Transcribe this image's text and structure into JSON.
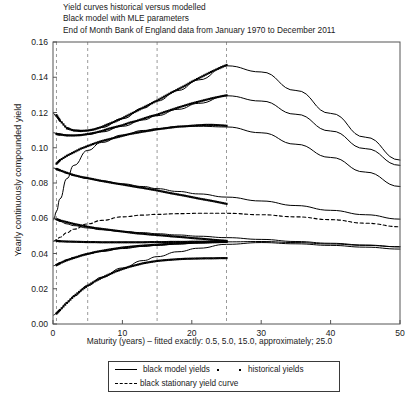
{
  "title": {
    "line1": "Yield curves historical versus modelled",
    "line2": "Black model with MLE parameters",
    "line3": "End of Month Bank of England data from January 1970 to December 2011"
  },
  "axes": {
    "ylabel": "Yearly continuously compounded yield",
    "xlabel": "Maturity (years) – fitted exactly: 0.5, 5.0, 15.0, approximately; 25.0",
    "yticks": [
      "0.00",
      "0.02",
      "0.04",
      "0.06",
      "0.08",
      "0.10",
      "0.12",
      "0.14",
      "0.16"
    ],
    "xticks": [
      "0",
      "10",
      "20",
      "30",
      "40",
      "50"
    ]
  },
  "legend": {
    "model_label": "black model yields",
    "historical_label": "historical yields",
    "stationary_label": "black stationary yield curve"
  },
  "chart_data": {
    "type": "line",
    "title": "Yield curves historical versus modelled",
    "subtitle": "Black model with MLE parameters; End of Month Bank of England data from January 1970 to December 2011",
    "xlabel": "Maturity (years) – fitted exactly: 0.5, 5.0, 15.0, approximately; 25.0",
    "ylabel": "Yearly continuously compounded yield",
    "xlim": [
      0,
      50
    ],
    "ylim": [
      0.0,
      0.16
    ],
    "grid": "vertical dashed at fitted maturities",
    "gridlines_x": [
      0.5,
      5.0,
      15.0,
      25.0
    ],
    "legend_position": "below-axes",
    "colors": {
      "line": "#000000",
      "marker": "#000000",
      "dashed": "#000000"
    },
    "series": [
      {
        "name": "model yield curve 1",
        "style": "solid",
        "x": [
          0.1,
          0.5,
          1,
          2,
          3,
          5,
          7,
          10,
          13,
          15,
          18,
          21,
          25,
          30,
          35,
          40,
          45,
          50
        ],
        "y": [
          0.1195,
          0.1175,
          0.115,
          0.1115,
          0.11,
          0.1098,
          0.1115,
          0.1165,
          0.1225,
          0.1265,
          0.1325,
          0.1385,
          0.1465,
          0.143,
          0.1325,
          0.1195,
          0.106,
          0.093
        ]
      },
      {
        "name": "historical yields 1",
        "style": "markers",
        "x": [
          0.5,
          1,
          2,
          3,
          4,
          5,
          6,
          7,
          8,
          9,
          10,
          11,
          12,
          13,
          14,
          15,
          16,
          17,
          18,
          19,
          20,
          21,
          22,
          23,
          24,
          25
        ],
        "y": [
          0.1185,
          0.1155,
          0.111,
          0.1098,
          0.1095,
          0.1098,
          0.1105,
          0.1118,
          0.1135,
          0.115,
          0.1168,
          0.1188,
          0.1208,
          0.1228,
          0.1248,
          0.1268,
          0.129,
          0.1312,
          0.1332,
          0.1352,
          0.1375,
          0.1395,
          0.1415,
          0.1435,
          0.1452,
          0.147
        ]
      },
      {
        "name": "model yield curve 2",
        "style": "solid",
        "x": [
          0.1,
          0.5,
          1,
          2,
          3,
          5,
          7,
          10,
          13,
          15,
          18,
          21,
          25,
          30,
          35,
          40,
          45,
          50
        ],
        "y": [
          0.1085,
          0.1082,
          0.1078,
          0.1072,
          0.107,
          0.1075,
          0.109,
          0.1122,
          0.1158,
          0.1182,
          0.1218,
          0.1252,
          0.1295,
          0.1265,
          0.119,
          0.1095,
          0.0995,
          0.09
        ]
      },
      {
        "name": "historical yields 2",
        "style": "markers",
        "x": [
          0.5,
          1,
          2,
          3,
          4,
          5,
          6,
          7,
          8,
          9,
          10,
          11,
          12,
          13,
          14,
          15,
          16,
          17,
          18,
          19,
          20,
          21,
          22,
          23,
          24,
          25
        ],
        "y": [
          0.1078,
          0.1075,
          0.107,
          0.107,
          0.1072,
          0.1078,
          0.1085,
          0.1095,
          0.1108,
          0.1118,
          0.1128,
          0.1142,
          0.1152,
          0.1165,
          0.1178,
          0.1188,
          0.1202,
          0.1215,
          0.1228,
          0.124,
          0.1252,
          0.1262,
          0.1272,
          0.1282,
          0.129,
          0.1298
        ]
      },
      {
        "name": "model yield curve 3 (rising from low short rate)",
        "style": "solid",
        "x": [
          0.1,
          0.5,
          1,
          2,
          3,
          5,
          7,
          10,
          13,
          15,
          18,
          21,
          25,
          30,
          35,
          40,
          45,
          50
        ],
        "y": [
          0.059,
          0.064,
          0.071,
          0.0825,
          0.09,
          0.0985,
          0.103,
          0.1072,
          0.1098,
          0.1108,
          0.112,
          0.1122,
          0.1118,
          0.1085,
          0.102,
          0.0945,
          0.0862,
          0.078
        ]
      },
      {
        "name": "historical yields 3",
        "style": "markers",
        "x": [
          0.5,
          1,
          2,
          3,
          4,
          5,
          6,
          7,
          8,
          9,
          10,
          11,
          12,
          13,
          14,
          15,
          16,
          17,
          18,
          19,
          20,
          21,
          22,
          23,
          24,
          25
        ],
        "y": [
          0.091,
          0.093,
          0.0955,
          0.0975,
          0.0995,
          0.101,
          0.1025,
          0.1038,
          0.1048,
          0.1058,
          0.1068,
          0.1078,
          0.1085,
          0.1092,
          0.1098,
          0.1105,
          0.111,
          0.1115,
          0.112,
          0.1122,
          0.1125,
          0.1128,
          0.113,
          0.113,
          0.1128,
          0.1125
        ]
      },
      {
        "name": "model yield curve 4 (declining from high short rate)",
        "style": "solid",
        "x": [
          0.1,
          0.5,
          1,
          2,
          3,
          5,
          7,
          10,
          13,
          15,
          18,
          21,
          25,
          30,
          35,
          40,
          45,
          50
        ],
        "y": [
          0.0885,
          0.088,
          0.0872,
          0.0855,
          0.0842,
          0.0825,
          0.0812,
          0.0795,
          0.078,
          0.0768,
          0.0752,
          0.0738,
          0.072,
          0.0698,
          0.0672,
          0.0645,
          0.062,
          0.0595
        ]
      },
      {
        "name": "historical yields 4",
        "style": "markers",
        "x": [
          0.5,
          1,
          2,
          3,
          4,
          5,
          6,
          7,
          8,
          9,
          10,
          11,
          12,
          13,
          14,
          15,
          16,
          17,
          18,
          19,
          20,
          21,
          22,
          23,
          24,
          25
        ],
        "y": [
          0.088,
          0.0872,
          0.0858,
          0.0845,
          0.0835,
          0.0828,
          0.082,
          0.0812,
          0.0805,
          0.0798,
          0.0792,
          0.0785,
          0.0778,
          0.0772,
          0.0765,
          0.0758,
          0.075,
          0.0742,
          0.0735,
          0.0728,
          0.072,
          0.0712,
          0.0705,
          0.0698,
          0.069,
          0.0682
        ]
      },
      {
        "name": "model yield curve 5 (mid declining)",
        "style": "solid",
        "x": [
          0.1,
          0.5,
          1,
          2,
          3,
          5,
          7,
          10,
          13,
          15,
          18,
          21,
          25,
          30,
          35,
          40,
          45,
          50
        ],
        "y": [
          0.06,
          0.0592,
          0.0582,
          0.0568,
          0.0558,
          0.0545,
          0.0535,
          0.0525,
          0.0518,
          0.0512,
          0.0505,
          0.0498,
          0.049,
          0.048,
          0.0468,
          0.0458,
          0.0448,
          0.0438
        ]
      },
      {
        "name": "historical yields 5",
        "style": "markers",
        "x": [
          0.5,
          1,
          2,
          3,
          4,
          5,
          6,
          7,
          8,
          9,
          10,
          11,
          12,
          13,
          14,
          15,
          16,
          17,
          18,
          19,
          20,
          21,
          22,
          23,
          24,
          25
        ],
        "y": [
          0.0595,
          0.0588,
          0.0578,
          0.0568,
          0.056,
          0.0552,
          0.0545,
          0.054,
          0.0535,
          0.053,
          0.0525,
          0.052,
          0.0515,
          0.0512,
          0.0508,
          0.0505,
          0.0502,
          0.0498,
          0.0495,
          0.0492,
          0.0488,
          0.0485,
          0.0482,
          0.0478,
          0.0475,
          0.0472
        ]
      },
      {
        "name": "historical yields 6 (flat ~0.047)",
        "style": "markers",
        "x": [
          0.5,
          1,
          2,
          3,
          4,
          5,
          6,
          7,
          8,
          9,
          10,
          11,
          12,
          13,
          14,
          15,
          16,
          17,
          18,
          19,
          20,
          21,
          22,
          23,
          24,
          25
        ],
        "y": [
          0.0472,
          0.047,
          0.0468,
          0.0467,
          0.0466,
          0.0465,
          0.0465,
          0.0464,
          0.0464,
          0.0464,
          0.0464,
          0.0464,
          0.0464,
          0.0464,
          0.0465,
          0.0465,
          0.0465,
          0.0466,
          0.0466,
          0.0466,
          0.0467,
          0.0467,
          0.0467,
          0.0468,
          0.0468,
          0.0468
        ]
      },
      {
        "name": "model yield curve 6 (from 0.033 rising)",
        "style": "solid",
        "x": [
          0.1,
          0.5,
          1,
          2,
          3,
          5,
          7,
          10,
          13,
          15,
          18,
          21,
          25,
          30,
          35,
          40,
          45,
          50
        ],
        "y": [
          0.033,
          0.0338,
          0.0348,
          0.0365,
          0.0378,
          0.0398,
          0.0412,
          0.0428,
          0.044,
          0.0446,
          0.0454,
          0.046,
          0.0466,
          0.0468,
          0.0462,
          0.0454,
          0.0446,
          0.0438
        ]
      },
      {
        "name": "historical yields 7",
        "style": "markers",
        "x": [
          0.5,
          1,
          2,
          3,
          4,
          5,
          6,
          7,
          8,
          9,
          10,
          11,
          12,
          13,
          14,
          15,
          16,
          17,
          18,
          19,
          20,
          21,
          22,
          23,
          24,
          25
        ],
        "y": [
          0.0335,
          0.0345,
          0.0362,
          0.0375,
          0.0388,
          0.0398,
          0.0408,
          0.0415,
          0.0422,
          0.0428,
          0.0434,
          0.0438,
          0.0442,
          0.0445,
          0.0448,
          0.045,
          0.0453,
          0.0455,
          0.0457,
          0.0459,
          0.0461,
          0.0462,
          0.0463,
          0.0464,
          0.0465,
          0.0466
        ]
      },
      {
        "name": "model yield curve 7 (from 0.005 rising)",
        "style": "solid",
        "x": [
          0.1,
          0.5,
          1,
          2,
          3,
          5,
          7,
          10,
          13,
          15,
          18,
          21,
          25,
          30,
          35,
          40,
          45,
          50
        ],
        "y": [
          0.005,
          0.0062,
          0.0082,
          0.0122,
          0.0158,
          0.0218,
          0.0265,
          0.0318,
          0.036,
          0.0382,
          0.041,
          0.043,
          0.0452,
          0.0462,
          0.0455,
          0.0446,
          0.0436,
          0.0425
        ]
      },
      {
        "name": "historical yields 8",
        "style": "markers",
        "x": [
          0.5,
          1,
          2,
          3,
          4,
          5,
          6,
          7,
          8,
          9,
          10,
          11,
          12,
          13,
          14,
          15,
          16,
          17,
          18,
          19,
          20,
          21,
          22,
          23,
          24,
          25
        ],
        "y": [
          0.006,
          0.008,
          0.012,
          0.0158,
          0.019,
          0.0218,
          0.0242,
          0.0262,
          0.028,
          0.0298,
          0.0312,
          0.0325,
          0.0335,
          0.0345,
          0.0352,
          0.0358,
          0.0362,
          0.0365,
          0.0368,
          0.037,
          0.0371,
          0.0372,
          0.0373,
          0.0373,
          0.0374,
          0.0374
        ]
      },
      {
        "name": "black stationary yield curve",
        "style": "dashed",
        "x": [
          0.1,
          0.5,
          1,
          2,
          3,
          5,
          7,
          10,
          13,
          15,
          18,
          21,
          25,
          30,
          35,
          40,
          45,
          50
        ],
        "y": [
          0.047,
          0.0478,
          0.0492,
          0.0518,
          0.0538,
          0.0568,
          0.0588,
          0.0608,
          0.0618,
          0.0622,
          0.0626,
          0.0628,
          0.0628,
          0.062,
          0.0608,
          0.0592,
          0.0572,
          0.0552
        ]
      }
    ]
  }
}
